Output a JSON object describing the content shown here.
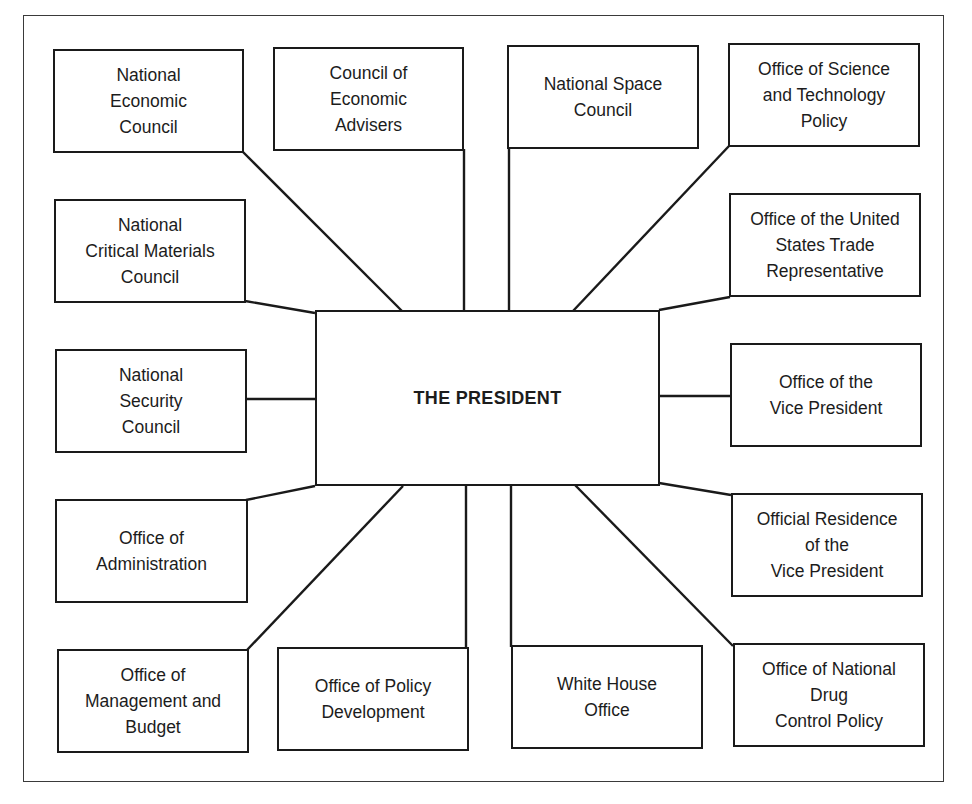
{
  "diagram": {
    "center": {
      "label": "THE PRESIDENT"
    },
    "offices": [
      {
        "id": "nec",
        "label": "National\nEconomic\nCouncil"
      },
      {
        "id": "cea",
        "label": "Council of\nEconomic\nAdvisers"
      },
      {
        "id": "nsc_space",
        "label": "National Space\nCouncil"
      },
      {
        "id": "ostp",
        "label": "Office of Science\nand Technology\nPolicy"
      },
      {
        "id": "ncmc",
        "label": "National\nCritical Materials\nCouncil"
      },
      {
        "id": "ustr",
        "label": "Office of the United\nStates Trade\nRepresentative"
      },
      {
        "id": "nsc",
        "label": "National\nSecurity\nCouncil"
      },
      {
        "id": "ovp",
        "label": "Office of the\nVice President"
      },
      {
        "id": "oa",
        "label": "Office of\nAdministration"
      },
      {
        "id": "orvp",
        "label": "Official Residence\nof the\nVice President"
      },
      {
        "id": "omb",
        "label": "Office of\nManagement and\nBudget"
      },
      {
        "id": "opd",
        "label": "Office of Policy\nDevelopment"
      },
      {
        "id": "who",
        "label": "White House\nOffice"
      },
      {
        "id": "ondcp",
        "label": "Office of National\nDrug\nControl Policy"
      }
    ]
  }
}
